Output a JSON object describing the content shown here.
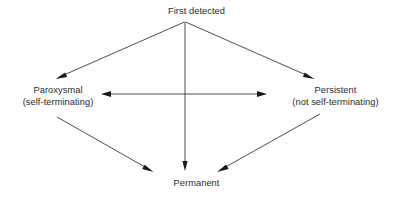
{
  "diagram": {
    "background_color": "#ffffff",
    "line_color": "#3a3a3a",
    "text_color": "#2b2b2b",
    "nodes": {
      "first_detected": {
        "label": "First detected",
        "lines": [
          "First detected"
        ]
      },
      "paroxysmal": {
        "label": "Paroxysmal (self-terminating)",
        "lines": [
          "Paroxysmal",
          "(self-terminating)"
        ]
      },
      "persistent": {
        "label": "Persistent (not self-terminating)",
        "lines": [
          "Persistent",
          "(not self-terminating)"
        ]
      },
      "permanent": {
        "label": "Permanent",
        "lines": [
          "Permanent"
        ]
      }
    },
    "edges": [
      {
        "name": "first-detected-to-paroxysmal",
        "from": "first_detected",
        "to": "paroxysmal",
        "style": "single-arrow"
      },
      {
        "name": "first-detected-to-persistent",
        "from": "first_detected",
        "to": "persistent",
        "style": "single-arrow"
      },
      {
        "name": "first-detected-to-permanent",
        "from": "first_detected",
        "to": "permanent",
        "style": "single-arrow"
      },
      {
        "name": "paroxysmal-to-permanent",
        "from": "paroxysmal",
        "to": "permanent",
        "style": "single-arrow"
      },
      {
        "name": "persistent-to-permanent",
        "from": "persistent",
        "to": "permanent",
        "style": "single-arrow"
      },
      {
        "name": "paroxysmal-persistent-bidirectional",
        "from": "paroxysmal",
        "to": "persistent",
        "style": "double-arrow"
      }
    ]
  }
}
